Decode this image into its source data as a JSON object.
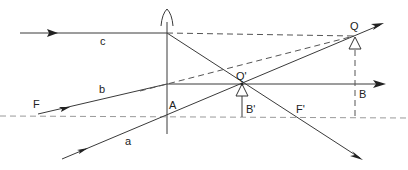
{
  "diagram": {
    "type": "thin-converging-lens-ray-diagram",
    "labels": {
      "c": "c",
      "b": "b",
      "a": "a",
      "F": "F",
      "A": "A",
      "Q_prime": "Q'",
      "B_prime": "B'",
      "F_prime": "F'",
      "B": "B",
      "Q": "Q"
    },
    "caption": "Figure (partially cropped)",
    "colors": {
      "ray": "#3a3a3a",
      "axis": "#9a9a9a",
      "background": "#ffffff"
    }
  }
}
